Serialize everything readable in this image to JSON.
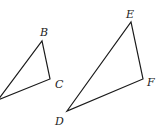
{
  "diagram": {
    "type": "geometry-similar-triangles",
    "triangles": [
      {
        "name": "triangle-ABC",
        "vertices": [
          {
            "label": "",
            "x": -2,
            "y": 100
          },
          {
            "label": "B",
            "x": 42,
            "y": 41,
            "lx": 40,
            "ly": 36
          },
          {
            "label": "C",
            "x": 50,
            "y": 79,
            "lx": 55,
            "ly": 88
          }
        ]
      },
      {
        "name": "triangle-DEF",
        "vertices": [
          {
            "label": "D",
            "x": 67,
            "y": 111,
            "lx": 55,
            "ly": 125
          },
          {
            "label": "E",
            "x": 131,
            "y": 22,
            "lx": 126,
            "ly": 18
          },
          {
            "label": "F",
            "x": 143,
            "y": 79,
            "lx": 147,
            "ly": 86
          }
        ]
      }
    ],
    "stroke_color": "#1a1a1a"
  }
}
